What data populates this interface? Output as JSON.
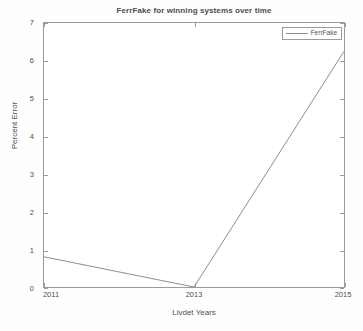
{
  "figure": {
    "background_color": "#fefefe",
    "axis_color": "#9b9b9b",
    "text_color": "#4e4e4e"
  },
  "chart_data": {
    "type": "line",
    "title": "FerrFake for winning systems over time",
    "xlabel": "Livdet Years",
    "ylabel": "Percent Error",
    "x": [
      2011,
      2013,
      2015
    ],
    "xticklabels": [
      "2011",
      "2013",
      "2015"
    ],
    "yticks": [
      0,
      1,
      2,
      3,
      4,
      5,
      6,
      7
    ],
    "yticklabels": [
      "0",
      "1",
      "2",
      "3",
      "4",
      "5",
      "6",
      "7"
    ],
    "xlim": [
      2011,
      2015
    ],
    "ylim": [
      0,
      7
    ],
    "grid": false,
    "legend_position": "upper right",
    "series": [
      {
        "name": "FerrFake",
        "values": [
          0.8,
          0.0,
          6.25
        ],
        "color": "#8e8e8e",
        "linewidth": 1,
        "marker": "none"
      }
    ]
  },
  "legend": {
    "entries": [
      {
        "label": "FerrFake",
        "color": "#8e8e8e"
      }
    ]
  }
}
